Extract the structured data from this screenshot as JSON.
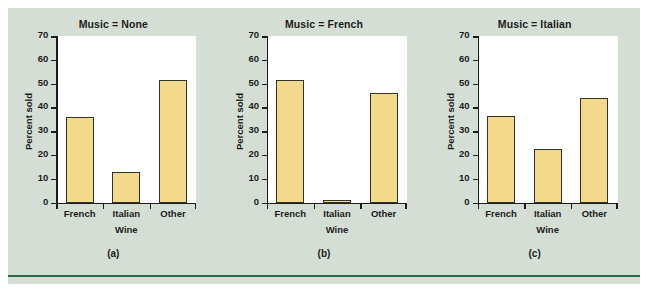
{
  "figure": {
    "background_color": "#d4ded4",
    "rule_color": "#2e6b4f",
    "bar_fill_color": "#f2d98c",
    "bar_edge_color": "#34352a",
    "plot_background_color": "#ffffff"
  },
  "chart_data": [
    {
      "type": "bar",
      "title": "Music = None",
      "caption": "(a)",
      "xlabel": "Wine",
      "ylabel": "Percent sold",
      "categories": [
        "French",
        "Italian",
        "Other"
      ],
      "values": [
        36.0,
        13.0,
        51.5
      ],
      "ylim": [
        0,
        70
      ],
      "yticks": [
        0,
        10,
        20,
        30,
        40,
        50,
        60,
        70
      ],
      "grid": false,
      "legend": "none"
    },
    {
      "type": "bar",
      "title": "Music = French",
      "caption": "(b)",
      "xlabel": "Wine",
      "ylabel": "Percent sold",
      "categories": [
        "French",
        "Italian",
        "Other"
      ],
      "values": [
        51.5,
        1.0,
        46.0
      ],
      "ylim": [
        0,
        70
      ],
      "yticks": [
        0,
        10,
        20,
        30,
        40,
        50,
        60,
        70
      ],
      "grid": false,
      "legend": "none"
    },
    {
      "type": "bar",
      "title": "Music = Italian",
      "caption": "(c)",
      "xlabel": "Wine",
      "ylabel": "Percent sold",
      "categories": [
        "French",
        "Italian",
        "Other"
      ],
      "values": [
        36.5,
        22.5,
        44.0
      ],
      "ylim": [
        0,
        70
      ],
      "yticks": [
        0,
        10,
        20,
        30,
        40,
        50,
        60,
        70
      ],
      "grid": false,
      "legend": "none"
    }
  ]
}
